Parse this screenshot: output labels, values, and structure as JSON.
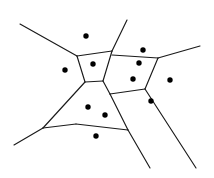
{
  "figure": {
    "background_color": "#ffffff",
    "edge_color": "#1a1a1a",
    "site_color": "#000000",
    "edge_width": 1.15,
    "site_radius": 2.7,
    "width": 214,
    "height": 178
  },
  "chart_data": {
    "type": "scatter",
    "xlabel": "",
    "ylabel": "",
    "xlim": [
      0,
      214
    ],
    "ylim": [
      0,
      178
    ],
    "grid": false,
    "legend": null,
    "sites": [
      {
        "id": "s1",
        "x": 86,
        "y": 36
      },
      {
        "id": "s2",
        "x": 65,
        "y": 70
      },
      {
        "id": "s3",
        "x": 93,
        "y": 64
      },
      {
        "id": "s4",
        "x": 143,
        "y": 50
      },
      {
        "id": "s5",
        "x": 139,
        "y": 63
      },
      {
        "id": "s6",
        "x": 133,
        "y": 79
      },
      {
        "id": "s7",
        "x": 170,
        "y": 80
      },
      {
        "id": "s8",
        "x": 151,
        "y": 101
      },
      {
        "id": "s9",
        "x": 88,
        "y": 107
      },
      {
        "id": "s10",
        "x": 105,
        "y": 115
      },
      {
        "id": "s11",
        "x": 96,
        "y": 136
      }
    ],
    "edges": [
      {
        "id": "e1",
        "x1": 20,
        "y1": 24,
        "x2": 77,
        "y2": 56,
        "kind": "ray"
      },
      {
        "id": "e2",
        "x1": 77,
        "y1": 56,
        "x2": 112,
        "y2": 51,
        "kind": "segment"
      },
      {
        "id": "e3",
        "x1": 112,
        "y1": 51,
        "x2": 127,
        "y2": 20,
        "kind": "ray"
      },
      {
        "id": "e4",
        "x1": 112,
        "y1": 51,
        "x2": 103,
        "y2": 81,
        "kind": "segment"
      },
      {
        "id": "e5",
        "x1": 112,
        "y1": 55,
        "x2": 158,
        "y2": 58,
        "kind": "segment"
      },
      {
        "id": "e6",
        "x1": 158,
        "y1": 58,
        "x2": 200,
        "y2": 46,
        "kind": "ray"
      },
      {
        "id": "e7",
        "x1": 158,
        "y1": 58,
        "x2": 145,
        "y2": 89,
        "kind": "segment"
      },
      {
        "id": "e8",
        "x1": 77,
        "y1": 56,
        "x2": 85,
        "y2": 82,
        "kind": "segment"
      },
      {
        "id": "e9",
        "x1": 85,
        "y1": 82,
        "x2": 103,
        "y2": 81,
        "kind": "segment"
      },
      {
        "id": "e10",
        "x1": 103,
        "y1": 81,
        "x2": 110,
        "y2": 94,
        "kind": "segment"
      },
      {
        "id": "e11",
        "x1": 110,
        "y1": 94,
        "x2": 145,
        "y2": 89,
        "kind": "segment"
      },
      {
        "id": "e12",
        "x1": 110,
        "y1": 94,
        "x2": 128,
        "y2": 130,
        "kind": "segment"
      },
      {
        "id": "e13",
        "x1": 85,
        "y1": 82,
        "x2": 43,
        "y2": 128,
        "kind": "segment"
      },
      {
        "id": "e14",
        "x1": 43,
        "y1": 128,
        "x2": 14,
        "y2": 145,
        "kind": "ray"
      },
      {
        "id": "e15",
        "x1": 43,
        "y1": 128,
        "x2": 76,
        "y2": 124,
        "kind": "segment"
      },
      {
        "id": "e16",
        "x1": 76,
        "y1": 124,
        "x2": 128,
        "y2": 130,
        "kind": "segment"
      },
      {
        "id": "e17",
        "x1": 128,
        "y1": 130,
        "x2": 150,
        "y2": 168,
        "kind": "ray"
      },
      {
        "id": "e18",
        "x1": 145,
        "y1": 89,
        "x2": 196,
        "y2": 168,
        "kind": "ray"
      }
    ]
  }
}
